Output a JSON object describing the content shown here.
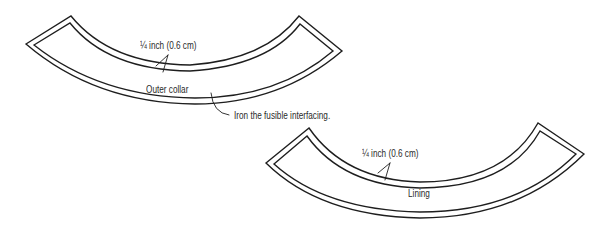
{
  "diagram": {
    "outer_collar": {
      "label": "Outer collar",
      "seam_label": "¼ inch (0.6 cm)"
    },
    "lining": {
      "label": "Lining",
      "seam_label": "¼ inch (0.6 cm)"
    },
    "callout": {
      "text": "Iron the fusible interfacing."
    },
    "colors": {
      "stroke": "#1e1e1e",
      "text": "#2b2b2b",
      "background": "#ffffff"
    }
  }
}
